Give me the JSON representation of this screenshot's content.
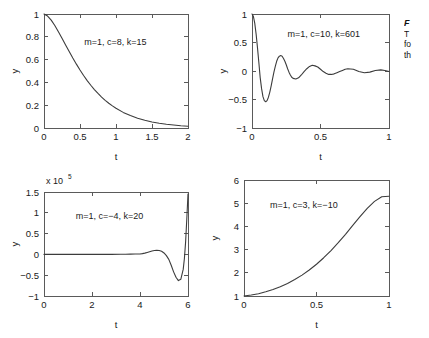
{
  "figure": {
    "background": "#ffffff",
    "curve_color": "#3c3c3c",
    "axis_color": "#5a5a5a"
  },
  "caption": {
    "title_fragment": "F",
    "line1_fragment": "T",
    "line2_fragment": "fo",
    "line3_fragment": "th"
  },
  "chart_data": [
    {
      "id": "top-left",
      "type": "line",
      "title": "",
      "annotation": "m=1, c=8, k=15",
      "xlabel": "t",
      "ylabel": "y",
      "xlim": [
        0,
        2
      ],
      "ylim": [
        0,
        1
      ],
      "xticks": [
        0,
        0.5,
        1,
        1.5,
        2
      ],
      "xticklabels": [
        "0",
        "0.5",
        "1",
        "1.5",
        "2"
      ],
      "yticks": [
        0,
        0.2,
        0.4,
        0.6,
        0.8,
        1
      ],
      "yticklabels": [
        "0",
        "0.2",
        "0.4",
        "0.6",
        "0.8",
        "1"
      ],
      "grid": false,
      "legend": "none",
      "y_multiplier": "",
      "x": [
        0,
        0.05,
        0.1,
        0.15,
        0.2,
        0.25,
        0.3,
        0.35,
        0.4,
        0.45,
        0.5,
        0.55,
        0.6,
        0.65,
        0.7,
        0.75,
        0.8,
        0.85,
        0.9,
        0.95,
        1,
        1.1,
        1.2,
        1.3,
        1.4,
        1.5,
        1.6,
        1.7,
        1.8,
        1.9,
        2
      ],
      "y": [
        1,
        0.982,
        0.946,
        0.899,
        0.845,
        0.788,
        0.729,
        0.671,
        0.614,
        0.56,
        0.509,
        0.461,
        0.416,
        0.375,
        0.337,
        0.303,
        0.271,
        0.243,
        0.217,
        0.194,
        0.173,
        0.137,
        0.109,
        0.086,
        0.068,
        0.053,
        0.042,
        0.033,
        0.026,
        0.02,
        0.016
      ]
    },
    {
      "id": "top-right",
      "type": "line",
      "title": "",
      "annotation": "m=1, c=10, k=601",
      "xlabel": "t",
      "ylabel": "y",
      "xlim": [
        0,
        1
      ],
      "ylim": [
        -1,
        1
      ],
      "xticks": [
        0,
        0.5,
        1
      ],
      "xticklabels": [
        "0",
        "0.5",
        "1"
      ],
      "yticks": [
        -1,
        -0.5,
        0,
        0.5,
        1
      ],
      "yticklabels": [
        "-1",
        "-0.5",
        "0",
        "0.5",
        "1"
      ],
      "grid": false,
      "legend": "none",
      "y_multiplier": "",
      "x": [
        0,
        0.01,
        0.02,
        0.03,
        0.04,
        0.05,
        0.06,
        0.07,
        0.08,
        0.09,
        0.1,
        0.11,
        0.12,
        0.13,
        0.14,
        0.15,
        0.16,
        0.17,
        0.18,
        0.19,
        0.2,
        0.21,
        0.22,
        0.23,
        0.24,
        0.25,
        0.26,
        0.27,
        0.28,
        0.29,
        0.3,
        0.32,
        0.34,
        0.36,
        0.38,
        0.4,
        0.42,
        0.44,
        0.46,
        0.48,
        0.5,
        0.52,
        0.54,
        0.56,
        0.58,
        0.6,
        0.62,
        0.64,
        0.66,
        0.68,
        0.7,
        0.74,
        0.78,
        0.82,
        0.86,
        0.9,
        0.94,
        0.97,
        1
      ],
      "y": [
        1,
        0.96,
        0.84,
        0.65,
        0.41,
        0.15,
        -0.12,
        -0.31,
        -0.45,
        -0.52,
        -0.54,
        -0.52,
        -0.46,
        -0.37,
        -0.26,
        -0.14,
        -0.02,
        0.08,
        0.17,
        0.23,
        0.26,
        0.27,
        0.26,
        0.22,
        0.17,
        0.11,
        0.04,
        -0.02,
        -0.07,
        -0.11,
        -0.13,
        -0.14,
        -0.12,
        -0.07,
        -0.01,
        0.04,
        0.08,
        0.1,
        0.09,
        0.07,
        0.03,
        -0.01,
        -0.04,
        -0.06,
        -0.06,
        -0.05,
        -0.03,
        -0.01,
        0.01,
        0.03,
        0.04,
        0.03,
        -0.01,
        -0.03,
        -0.02,
        0.01,
        0.02,
        0.01,
        -0.01
      ]
    },
    {
      "id": "bottom-left",
      "type": "line",
      "title": "",
      "annotation": "m=1, c=-4, k=20",
      "xlabel": "t",
      "ylabel": "y",
      "xlim": [
        0,
        6
      ],
      "ylim": [
        -1,
        1.5
      ],
      "xticks": [
        0,
        2,
        4,
        6
      ],
      "xticklabels": [
        "0",
        "2",
        "4",
        "6"
      ],
      "yticks": [
        -1,
        -0.5,
        0,
        0.5,
        1,
        1.5
      ],
      "yticklabels": [
        "-1",
        "-0.5",
        "0",
        "0.5",
        "1",
        "1.5"
      ],
      "grid": false,
      "legend": "none",
      "y_multiplier": "x 10",
      "y_multiplier_exponent": "5",
      "x": [
        0,
        0.4,
        0.8,
        1.2,
        1.6,
        2,
        2.4,
        2.8,
        3.2,
        3.4,
        3.6,
        3.8,
        4,
        4.1,
        4.2,
        4.3,
        4.4,
        4.5,
        4.6,
        4.7,
        4.8,
        4.9,
        5,
        5.1,
        5.2,
        5.3,
        5.4,
        5.5,
        5.6,
        5.7,
        5.8,
        5.85,
        5.9,
        5.95,
        6
      ],
      "y": [
        0,
        0,
        0,
        0,
        0,
        0,
        0,
        0,
        0.002,
        0.004,
        0.006,
        0.008,
        0.01,
        0.018,
        0.03,
        0.047,
        0.065,
        0.082,
        0.094,
        0.1,
        0.095,
        0.075,
        0.035,
        -0.03,
        -0.12,
        -0.26,
        -0.42,
        -0.55,
        -0.63,
        -0.6,
        -0.36,
        -0.1,
        0.3,
        0.85,
        1.45
      ]
    },
    {
      "id": "bottom-right",
      "type": "line",
      "title": "",
      "annotation": "m=1, c=3, k=-10",
      "xlabel": "t",
      "ylabel": "y",
      "xlim": [
        0,
        1
      ],
      "ylim": [
        1,
        6
      ],
      "xticks": [
        0,
        0.5,
        1
      ],
      "xticklabels": [
        "0",
        "0.5",
        "1"
      ],
      "yticks": [
        1,
        2,
        3,
        4,
        5,
        6
      ],
      "yticklabels": [
        "1",
        "2",
        "3",
        "4",
        "5",
        "6"
      ],
      "grid": false,
      "legend": "none",
      "y_multiplier": "",
      "x": [
        0,
        0.05,
        0.1,
        0.15,
        0.2,
        0.25,
        0.3,
        0.35,
        0.4,
        0.45,
        0.5,
        0.55,
        0.6,
        0.65,
        0.7,
        0.75,
        0.8,
        0.85,
        0.9,
        0.95,
        1
      ],
      "y": [
        1,
        1.04,
        1.1,
        1.18,
        1.28,
        1.4,
        1.54,
        1.71,
        1.9,
        2.12,
        2.37,
        2.65,
        2.96,
        3.3,
        3.66,
        4.04,
        4.42,
        4.78,
        5.08,
        5.28,
        5.3
      ]
    }
  ]
}
